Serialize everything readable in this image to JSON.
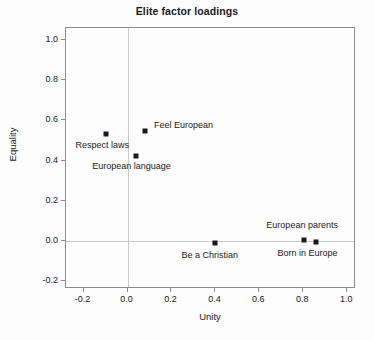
{
  "chart_data": {
    "type": "scatter",
    "title": "Elite factor loadings",
    "xlabel": "Unity",
    "ylabel": "Equality",
    "xlim": [
      -0.28,
      1.04
    ],
    "ylim": [
      -0.24,
      1.06
    ],
    "xticks": [
      -0.2,
      0.0,
      0.2,
      0.4,
      0.6,
      0.8,
      1.0
    ],
    "xticklabels": [
      "-0.2",
      "0.0",
      "0.2",
      "0.4",
      "0.6",
      "0.8",
      "1.0"
    ],
    "yticks": [
      -0.2,
      0.0,
      0.2,
      0.4,
      0.6,
      0.8,
      1.0
    ],
    "yticklabels": [
      "-0.2",
      "0.0",
      "0.2",
      "0.4",
      "0.6",
      "0.8",
      "1.0"
    ],
    "grid": "zero-lines-only",
    "legend": "none",
    "marker_color": "#1a1a1a",
    "marker_shape": "square",
    "points": [
      {
        "label": "Respect laws",
        "x": -0.1,
        "y": 0.53,
        "label_dx": -30,
        "label_dy": 14
      },
      {
        "label": "Feel European",
        "x": 0.08,
        "y": 0.545,
        "label_dx": 9,
        "label_dy": -3
      },
      {
        "label": "European language",
        "x": 0.04,
        "y": 0.42,
        "label_dx": -44,
        "label_dy": 13
      },
      {
        "label": "Be a Christian",
        "x": 0.4,
        "y": -0.01,
        "label_dx": -34,
        "label_dy": 15
      },
      {
        "label": "European parents",
        "x": 0.805,
        "y": 0.005,
        "label_dx": -38,
        "label_dy": -12
      },
      {
        "label": "Born in Europe",
        "x": 0.86,
        "y": -0.005,
        "label_dx": -39,
        "label_dy": 14
      }
    ]
  }
}
